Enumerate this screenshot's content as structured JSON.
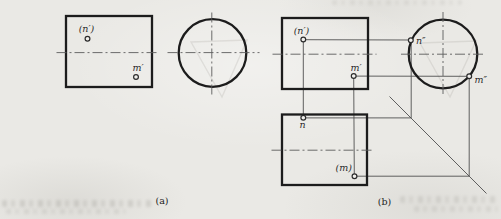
{
  "figure": {
    "captions": {
      "a": "(a)",
      "b": "(b)"
    },
    "part_a": {
      "labels": {
        "n_prime": "(n′)",
        "m_prime": "m′"
      }
    },
    "part_b": {
      "labels": {
        "n_prime": "(n′)",
        "m_prime": "m′",
        "n_dprime": "n″",
        "m_dprime": "m″",
        "n": "n",
        "m_paren": "(m)"
      }
    },
    "colors": {
      "ink": "#1c1c1c",
      "thin_line": "#4f4f4f",
      "paper": "#eae9e5"
    }
  }
}
